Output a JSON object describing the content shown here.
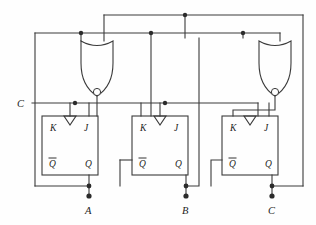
{
  "diagram": {
    "colors": {
      "wire": "#3a3a3a",
      "node": "#2b2b2b",
      "text": "#1d1d1d",
      "background": "#fefefe"
    }
  },
  "clock": {
    "label": "C",
    "x": 22,
    "y": 103
  },
  "flipflops": [
    {
      "id": "ff-a",
      "pins": {
        "k": "K",
        "j": "J",
        "qbar": "Q",
        "q": "Q"
      },
      "clock_icon": "falling-edge-triangle",
      "output_label": "A",
      "box": {
        "x": 42,
        "y": 116,
        "w": 56,
        "h": 59
      }
    },
    {
      "id": "ff-b",
      "pins": {
        "k": "K",
        "j": "J",
        "qbar": "Q",
        "q": "Q"
      },
      "clock_icon": "falling-edge-triangle",
      "output_label": "B",
      "box": {
        "x": 132,
        "y": 116,
        "w": 56,
        "h": 59
      }
    },
    {
      "id": "ff-c",
      "pins": {
        "k": "K",
        "j": "J",
        "qbar": "Q",
        "q": "Q"
      },
      "clock_icon": "falling-edge-triangle",
      "output_label": "C",
      "box": {
        "x": 222,
        "y": 116,
        "w": 56,
        "h": 59
      }
    }
  ],
  "gates": [
    {
      "id": "gate-1",
      "type": "nand",
      "inputs": 2,
      "orientation": "down",
      "bubble": true
    },
    {
      "id": "gate-2",
      "type": "nand",
      "inputs": 2,
      "orientation": "down",
      "bubble": true
    }
  ],
  "outputs": [
    {
      "label": "A",
      "x": 89,
      "y": 208
    },
    {
      "label": "B",
      "x": 186,
      "y": 208
    },
    {
      "label": "C",
      "x": 272,
      "y": 208
    }
  ]
}
